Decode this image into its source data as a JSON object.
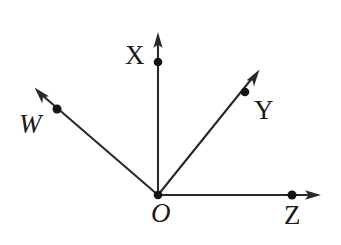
{
  "figure": {
    "kind": "vector-axes-diagram",
    "background_color": "#ffffff",
    "stroke_color": "#2a2a2a",
    "width": 341,
    "height": 245,
    "origin": {
      "x": 158,
      "y": 195,
      "label": "O"
    },
    "rays": [
      {
        "id": "x-axis",
        "label": "X",
        "from": {
          "x": 158,
          "y": 195
        },
        "to": {
          "x": 158,
          "y": 33
        },
        "point": {
          "x": 158,
          "y": 62
        },
        "label_position": {
          "x": 125,
          "y": 42
        },
        "direction": "up",
        "arrowhead": true
      },
      {
        "id": "y-axis",
        "label": "Y",
        "from": {
          "x": 158,
          "y": 195
        },
        "to": {
          "x": 259,
          "y": 70
        },
        "point": {
          "x": 245,
          "y": 92
        },
        "label_position": {
          "x": 254,
          "y": 97
        },
        "direction": "up-right",
        "arrowhead": true
      },
      {
        "id": "w-axis",
        "label": "W",
        "from": {
          "x": 158,
          "y": 195
        },
        "to": {
          "x": 35,
          "y": 88
        },
        "point": {
          "x": 57,
          "y": 109
        },
        "label_position": {
          "x": 19,
          "y": 111
        },
        "direction": "up-left",
        "arrowhead": true
      },
      {
        "id": "z-axis",
        "label": "Z",
        "from": {
          "x": 158,
          "y": 195
        },
        "to": {
          "x": 321,
          "y": 195
        },
        "point": {
          "x": 292,
          "y": 195
        },
        "label_position": {
          "x": 284,
          "y": 202
        },
        "direction": "right",
        "arrowhead": true
      }
    ]
  }
}
